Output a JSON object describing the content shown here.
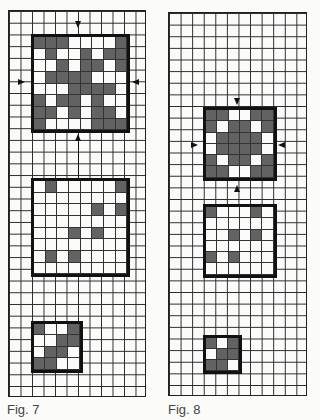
{
  "figures": [
    {
      "caption": "Fig. 7",
      "grid": {
        "x": 8,
        "y": 10,
        "w": 138,
        "h": 387,
        "cell_w": 11.5,
        "cell_h": 11.73,
        "cols": 12,
        "rows": 33
      },
      "blocks": [
        {
          "name": "pattern-block-large",
          "x": 31,
          "y": 34,
          "size": 8,
          "cell": 11.9,
          "cells": [
            [
              1,
              1,
              1,
              0,
              0,
              0,
              0,
              1
            ],
            [
              0,
              1,
              0,
              0,
              1,
              0,
              1,
              1
            ],
            [
              0,
              0,
              1,
              0,
              1,
              1,
              0,
              1
            ],
            [
              0,
              1,
              1,
              1,
              1,
              0,
              0,
              0
            ],
            [
              0,
              0,
              0,
              1,
              1,
              1,
              1,
              0
            ],
            [
              1,
              0,
              1,
              1,
              0,
              1,
              0,
              0
            ],
            [
              1,
              1,
              0,
              1,
              0,
              1,
              1,
              0
            ],
            [
              1,
              0,
              0,
              0,
              0,
              1,
              1,
              1
            ]
          ]
        },
        {
          "name": "pattern-block-sparse",
          "x": 31,
          "y": 178,
          "size": 8,
          "cell": 11.9,
          "cells": [
            [
              0,
              1,
              0,
              0,
              0,
              0,
              0,
              1
            ],
            [
              0,
              0,
              0,
              0,
              0,
              0,
              0,
              0
            ],
            [
              0,
              0,
              0,
              0,
              0,
              1,
              0,
              1
            ],
            [
              0,
              0,
              0,
              0,
              0,
              0,
              0,
              0
            ],
            [
              0,
              0,
              0,
              1,
              0,
              1,
              0,
              0
            ],
            [
              0,
              0,
              0,
              0,
              0,
              0,
              0,
              0
            ],
            [
              0,
              1,
              0,
              1,
              0,
              0,
              0,
              0
            ],
            [
              0,
              0,
              0,
              0,
              0,
              0,
              0,
              0
            ]
          ]
        },
        {
          "name": "pattern-block-small",
          "x": 31,
          "y": 321,
          "size": 4,
          "cell": 11.9,
          "cells": [
            [
              1,
              0,
              0,
              1
            ],
            [
              0,
              0,
              1,
              1
            ],
            [
              0,
              1,
              1,
              0
            ],
            [
              1,
              1,
              0,
              0
            ]
          ]
        }
      ],
      "arrows": [
        {
          "dir": "down",
          "x": 75,
          "y": 21
        },
        {
          "dir": "right",
          "x": 18,
          "y": 79
        },
        {
          "dir": "left",
          "x": 132,
          "y": 79
        },
        {
          "dir": "up",
          "x": 75,
          "y": 134
        }
      ],
      "connector": {
        "x": 78,
        "y1": 140,
        "y2": 178
      }
    },
    {
      "caption": "Fig. 8",
      "grid": {
        "x": 168,
        "y": 12,
        "w": 139,
        "h": 384,
        "cell_w": 11.58,
        "cell_h": 11.64,
        "cols": 12,
        "rows": 33
      },
      "blocks": [
        {
          "name": "pattern-block-medium",
          "x": 203,
          "y": 107,
          "size": 6,
          "cell": 11.6,
          "cells": [
            [
              1,
              1,
              0,
              0,
              1,
              1
            ],
            [
              1,
              0,
              1,
              1,
              0,
              1
            ],
            [
              0,
              1,
              1,
              1,
              1,
              0
            ],
            [
              0,
              1,
              1,
              1,
              1,
              0
            ],
            [
              1,
              0,
              1,
              1,
              0,
              1
            ],
            [
              1,
              1,
              0,
              0,
              1,
              1
            ]
          ]
        },
        {
          "name": "pattern-block-sparse",
          "x": 203,
          "y": 204,
          "size": 6,
          "cell": 11.6,
          "cells": [
            [
              1,
              0,
              0,
              0,
              1,
              0
            ],
            [
              0,
              0,
              0,
              0,
              0,
              0
            ],
            [
              0,
              0,
              1,
              0,
              1,
              0
            ],
            [
              0,
              0,
              0,
              0,
              0,
              0
            ],
            [
              1,
              0,
              1,
              0,
              0,
              0
            ],
            [
              0,
              0,
              0,
              0,
              0,
              0
            ]
          ]
        },
        {
          "name": "pattern-block-small",
          "x": 203,
          "y": 335,
          "size": 3,
          "cell": 11.6,
          "cells": [
            [
              1,
              0,
              1
            ],
            [
              0,
              1,
              1
            ],
            [
              1,
              1,
              0
            ]
          ]
        }
      ],
      "arrows": [
        {
          "dir": "down",
          "x": 234,
          "y": 98
        },
        {
          "dir": "right",
          "x": 191,
          "y": 142
        },
        {
          "dir": "left",
          "x": 278,
          "y": 142
        },
        {
          "dir": "up",
          "x": 234,
          "y": 185
        }
      ]
    }
  ]
}
